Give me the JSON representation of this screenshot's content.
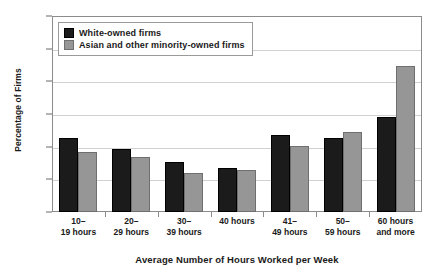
{
  "chart_data": {
    "type": "bar",
    "title": "",
    "xlabel": "Average Number of Hours Worked per Week",
    "ylabel": "Percentage of Firms",
    "ylim": [
      0,
      30
    ],
    "ytick_values": [
      0,
      5,
      10,
      15,
      20,
      25,
      30
    ],
    "ytick_labels": [
      "0",
      "5",
      "10",
      "15",
      "20",
      "25",
      "30"
    ],
    "grid": true,
    "grid_axis": "y",
    "legend_position": "upper-left-inside",
    "categories": [
      "10–\n19 hours",
      "20–\n29 hours",
      "30–\n39 hours",
      "40 hours",
      "41–\n49 hours",
      "50–\n59 hours",
      "60 hours\nand more"
    ],
    "category_lines": [
      [
        "10–",
        "19 hours"
      ],
      [
        "20–",
        "29 hours"
      ],
      [
        "30–",
        "39 hours"
      ],
      [
        "40 hours",
        ""
      ],
      [
        "41–",
        "49 hours"
      ],
      [
        "50–",
        "59 hours"
      ],
      [
        "60 hours",
        "and more"
      ]
    ],
    "series": [
      {
        "name": "White-owned firms",
        "color": "#1b1b1b",
        "values": [
          11.3,
          9.6,
          7.6,
          6.7,
          11.8,
          11.3,
          14.6
        ]
      },
      {
        "name": "Asian and other minority-owned firms",
        "color": "#969696",
        "values": [
          9.2,
          8.4,
          6.0,
          6.5,
          10.1,
          12.3,
          22.3
        ]
      }
    ]
  },
  "legend": {
    "items": [
      {
        "label": "White-owned firms",
        "swatch": "black-square-icon"
      },
      {
        "label": "Asian and other minority-owned firms",
        "swatch": "gray-square-icon"
      }
    ]
  }
}
